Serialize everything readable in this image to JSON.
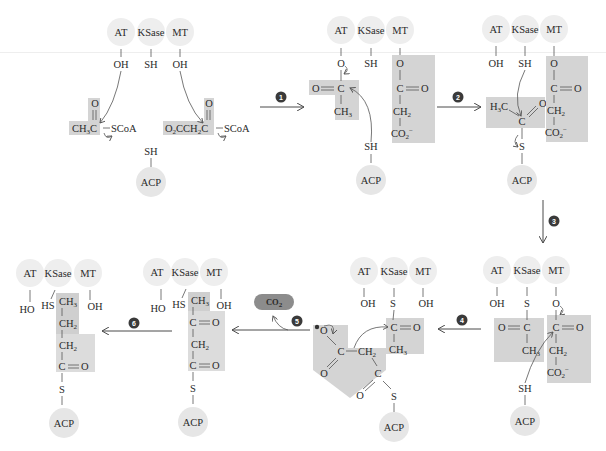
{
  "diagram": {
    "colors": {
      "enzyme_circle": "#eeeeee",
      "shade_light": "#e3e3e3",
      "shade_dark": "#cfcfcf",
      "badge": "#3a3a3a",
      "co2_badge": "#8c8c8c",
      "line": "#4a4a4a"
    },
    "enzymes": {
      "at": "AT",
      "ksase": "KSase",
      "mt": "MT",
      "acp": "ACP"
    },
    "groups": {
      "oh": "OH",
      "ho": "HO",
      "sh": "SH",
      "hs": "HS",
      "s": "S",
      "o": "O",
      "c": "C",
      "ch3": "CH",
      "ch2": "CH",
      "co2": "CO",
      "h3c": "H",
      "scoa": "SCoA"
    },
    "steps": [
      {
        "number": "1",
        "direction": "right"
      },
      {
        "number": "2",
        "direction": "right"
      },
      {
        "number": "3",
        "direction": "down"
      },
      {
        "number": "4",
        "direction": "left"
      },
      {
        "number": "5",
        "direction": "left",
        "byproduct": "CO2"
      },
      {
        "number": "6",
        "direction": "left"
      }
    ],
    "panels": [
      {
        "id": "start",
        "substrates": [
          "CH3C(=O)–SCoA (acetyl-CoA)",
          "O2CCH2C(=O)–SCoA (malonyl-CoA)"
        ]
      },
      {
        "id": "after-step-1",
        "at": "O–C(=O)CH3",
        "ksase": "SH",
        "mt": "O–C(=O)–CH2–CO2-",
        "acp": "SH"
      },
      {
        "id": "after-step-2",
        "at": "OH",
        "ksase": "SH",
        "mt": "O–C(=O)–CH2–CO2-",
        "acp": "S–C(=O)CH3"
      },
      {
        "id": "after-step-3",
        "at": "OH",
        "ksase": "S–C(=O)CH3",
        "mt": "O–C(=O)–CH2–CO2-",
        "acp": "SH"
      },
      {
        "id": "after-step-4",
        "at": "OH",
        "ksase": "S–C(=O)CH3",
        "mt": "OH",
        "acp": "S–C(=O)–CH2–CO2-"
      },
      {
        "id": "after-step-5",
        "at": "HO",
        "ksase": "HS",
        "mt": "OH",
        "acp": "S–C(=O)–CH2–C(=O)–CH3"
      },
      {
        "id": "after-step-6",
        "at": "HO",
        "ksase": "HS",
        "mt": "OH",
        "acp": "S–C(=O)–CH2–CH2–CH3"
      }
    ]
  }
}
